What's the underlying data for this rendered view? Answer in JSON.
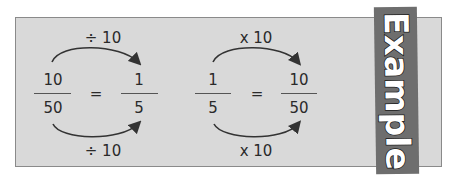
{
  "example_1": {
    "top_label": "÷ 10",
    "bottom_label": "÷ 10",
    "left_fraction": {
      "numerator": "10",
      "denominator": "50"
    },
    "equals": "=",
    "right_fraction": {
      "numerator": "1",
      "denominator": "5"
    }
  },
  "example_2": {
    "top_label": "x 10",
    "bottom_label": "x 10",
    "left_fraction": {
      "numerator": "1",
      "denominator": "5"
    },
    "equals": "=",
    "right_fraction": {
      "numerator": "10",
      "denominator": "50"
    }
  },
  "banner": {
    "label": "Example",
    "color": "#6e6e6e"
  },
  "colors": {
    "panel": "#d9d9d9",
    "text": "#2a2a2a",
    "arrow": "#333333"
  }
}
